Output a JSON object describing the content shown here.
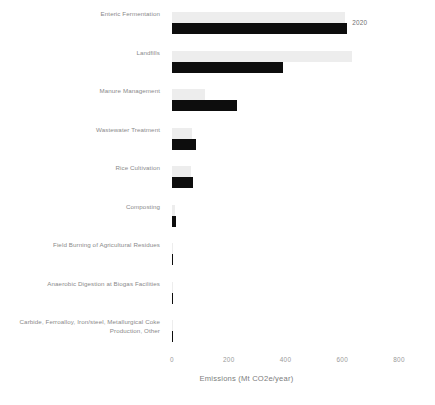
{
  "chart_data": {
    "type": "bar",
    "orientation": "horizontal",
    "title": "",
    "xlabel": "Emissions (Mt CO2e/year)",
    "ylabel": "",
    "xlim": [
      0,
      800
    ],
    "xticks": [
      0,
      200,
      400,
      600,
      800
    ],
    "xticklabels": [
      "0",
      "200",
      "400",
      "600",
      "800"
    ],
    "grid": false,
    "legend": "none",
    "annotation": "2020",
    "categories": [
      "Enteric Fermentation",
      "Landfills",
      "Manure Management",
      "Wastewater Treatment",
      "Rice Cultivation",
      "Composting",
      "Field Burning of Agricultural Residues",
      "Anaerobic Digestion at Biogas Facilities",
      "Carbide, Ferroalloy, Iron/steel, Metallurgical Coke Production, Other"
    ],
    "series": [
      {
        "name": "earlier",
        "color": "#ededed",
        "values": [
          610,
          635,
          118,
          72,
          66,
          9,
          3,
          2,
          1
        ]
      },
      {
        "name": "2020",
        "color": "#0d0d0d",
        "values": [
          618,
          390,
          228,
          86,
          74,
          14,
          4,
          2,
          1
        ]
      }
    ]
  },
  "footer": {
    "cutoff_text": ""
  }
}
